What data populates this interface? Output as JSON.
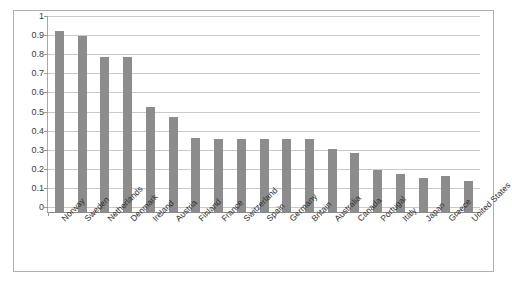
{
  "chart_data": {
    "type": "bar",
    "title": "",
    "subtitle": "",
    "xlabel": "",
    "ylabel": "",
    "ylim": [
      0,
      1
    ],
    "grid": true,
    "legend": "none",
    "bar_color": "#8c8c8c",
    "plot_background": "#ffffff",
    "border_color": "#b0b0b0",
    "gridline_color": "#c9c9c9",
    "ytick_labels": [
      "1",
      "0.9",
      "0.8",
      "0.7",
      "0.6",
      "0.5",
      "0.4",
      "0.3",
      "0.2",
      "0.1",
      "0"
    ],
    "ytick_values": [
      1,
      0.9,
      0.8,
      0.7,
      0.6,
      0.5,
      0.4,
      0.3,
      0.2,
      0.1,
      0
    ],
    "categories": [
      "Norway",
      "Sweden",
      "Netherlands",
      "Denmark",
      "Ireland",
      "Austria",
      "Finland",
      "France",
      "Switzerland",
      "Spain",
      "Germany",
      "Britain",
      "Australia",
      "Canada",
      "Portugal",
      "Italy",
      "Japan",
      "Greece",
      "United States"
    ],
    "values": [
      0.95,
      0.92,
      0.81,
      0.81,
      0.55,
      0.5,
      0.39,
      0.38,
      0.38,
      0.38,
      0.38,
      0.38,
      0.33,
      0.31,
      0.22,
      0.2,
      0.18,
      0.19,
      0.16
    ]
  }
}
